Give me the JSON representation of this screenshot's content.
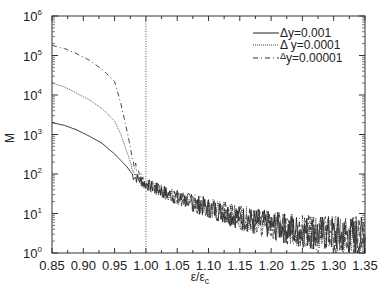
{
  "chart_data": {
    "type": "line",
    "title": "",
    "xlabel": "ε/ε",
    "xlabel_sub": "c",
    "ylabel": "M",
    "yscale": "log",
    "xlim": [
      0.85,
      1.35
    ],
    "ylim": [
      1,
      1000000
    ],
    "grid": false,
    "legend_position": "upper right",
    "x_ticks": [
      "0.85",
      "0.90",
      "0.95",
      "1.00",
      "1.05",
      "1.10",
      "1.15",
      "1.20",
      "1.25",
      "1.30",
      "1.35"
    ],
    "y_ticks": [
      {
        "base": "10",
        "exp": "0"
      },
      {
        "base": "10",
        "exp": "1"
      },
      {
        "base": "10",
        "exp": "2"
      },
      {
        "base": "10",
        "exp": "3"
      },
      {
        "base": "10",
        "exp": "4"
      },
      {
        "base": "10",
        "exp": "5"
      },
      {
        "base": "10",
        "exp": "6"
      }
    ],
    "reference_line": {
      "x": 1.0,
      "style": "dotted"
    },
    "x": [
      0.85,
      0.87,
      0.89,
      0.91,
      0.93,
      0.95,
      0.96,
      0.97,
      0.98,
      0.99,
      1.0,
      1.02,
      1.05,
      1.1,
      1.15,
      1.2,
      1.25,
      1.3,
      1.35
    ],
    "series": [
      {
        "name": "Δy=0.001",
        "style": "solid",
        "values": [
          2000,
          1700,
          1300,
          900,
          600,
          320,
          220,
          150,
          90,
          70,
          55,
          40,
          25,
          14,
          8,
          5,
          3.5,
          3,
          2.5
        ]
      },
      {
        "name": "Δy=0.0001",
        "style": "dotted",
        "values": [
          20000,
          16000,
          11000,
          7500,
          4500,
          2200,
          1000,
          350,
          120,
          75,
          55,
          40,
          25,
          14,
          8,
          5,
          3.5,
          3,
          2.5
        ]
      },
      {
        "name": "Δy=0.00001",
        "style": "dashdot",
        "values": [
          180000,
          150000,
          110000,
          75000,
          45000,
          22000,
          6000,
          1200,
          200,
          85,
          55,
          40,
          25,
          14,
          8,
          5,
          3.5,
          3,
          2.5
        ]
      }
    ]
  },
  "legend": {
    "items": [
      {
        "delta": "Δ",
        "label": "y=0.001"
      },
      {
        "delta": "Δ",
        "label": " y=0.0001"
      },
      {
        "delta": "Δ",
        "label": "y=0.00001"
      }
    ]
  },
  "axes": {
    "ylabel": "M",
    "xlabel": "ε/ε",
    "xlabel_sub": "c"
  }
}
